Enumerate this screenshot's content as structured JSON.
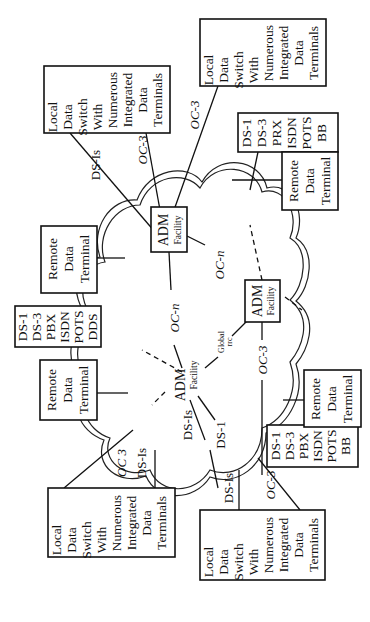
{
  "diagram": {
    "orientation": "rotated-90-ccw",
    "local_switches": [
      {
        "id": "ls-top-left",
        "lines": [
          "Local",
          "Data",
          "Switch",
          "With",
          "Numerous",
          "Integrated",
          "Data",
          "Terminals"
        ]
      },
      {
        "id": "ls-top-right",
        "lines": [
          "Local",
          "Data",
          "Switch",
          "With",
          "Numerous",
          "Integrated",
          "Data",
          "Terminals"
        ]
      },
      {
        "id": "ls-bottom-left",
        "lines": [
          "Local",
          "Data",
          "Switch",
          "With",
          "Numerous",
          "Integrated",
          "Data",
          "Terminals"
        ]
      },
      {
        "id": "ls-bottom-right",
        "lines": [
          "Local",
          "Data",
          "Switch",
          "With",
          "Numerous",
          "Integrated",
          "Data",
          "Terminals"
        ]
      }
    ],
    "remote_terminals": [
      {
        "id": "rdt-top-right",
        "lines": [
          "Remote",
          "Data",
          "Terminal"
        ]
      },
      {
        "id": "rdt-left-upper",
        "lines": [
          "Remote",
          "Data",
          "Terminal"
        ]
      },
      {
        "id": "rdt-left-lower",
        "lines": [
          "Remote",
          "Data",
          "Terminal"
        ]
      },
      {
        "id": "rdt-bottom-right",
        "lines": [
          "Remote",
          "Data",
          "Terminal"
        ]
      }
    ],
    "service_boxes": [
      {
        "id": "svc-top-right",
        "lines": [
          "DS-1",
          "DS-3",
          "PRX",
          "ISDN",
          "POTS",
          "BB"
        ]
      },
      {
        "id": "svc-left",
        "lines": [
          "DS-1",
          "DS-3",
          "PBX",
          "ISDN",
          "POTS",
          "DDS"
        ]
      },
      {
        "id": "svc-bottom-right",
        "lines": [
          "DS-1",
          "DS-3",
          "PBX",
          "ISDN",
          "POTS",
          "BB"
        ]
      }
    ],
    "adm_nodes": [
      {
        "id": "adm-top",
        "label": "ADM",
        "sublabel": "Facility"
      },
      {
        "id": "adm-right",
        "label": "ADM",
        "sublabel": "Facility"
      },
      {
        "id": "adm-left",
        "label": "ADM",
        "sublabel": "Facility"
      }
    ],
    "link_labels": {
      "ds1s_top": "DS-Is",
      "oc3_top_left": "OC-3",
      "oc3_top_right": "OC-3",
      "ocn_upper": "OC-n",
      "ocn_middle": "OC-n",
      "oc3_right": "OC-3",
      "global": "Global",
      "global_sub": "rrc",
      "ds1": "DS-1",
      "ds1s_left": "DS-Is",
      "oc3_bottom_left": "OC 3",
      "ds1s_bottom_left": "DS-Is",
      "ds1s_bottom_right": "DS-Is",
      "oc3_bottom_right": "OC-3"
    }
  }
}
